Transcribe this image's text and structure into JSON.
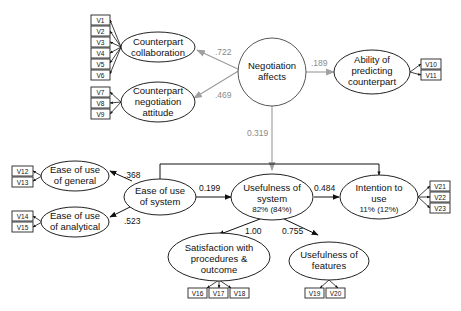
{
  "diagram": {
    "type": "structural-equation-model",
    "constructs": {
      "negotiation_affects": {
        "label_lines": [
          "Negotiation",
          "affects"
        ],
        "shape": "circle"
      },
      "counterpart_collaboration": {
        "label_lines": [
          "Counterpart",
          "collaboration"
        ],
        "indicators": [
          "V1",
          "V2",
          "V3",
          "V4",
          "V5",
          "V6"
        ]
      },
      "counterpart_negotiation_attitude": {
        "label_lines": [
          "Counterpart",
          "negotiation",
          "attitude"
        ],
        "indicators": [
          "V7",
          "V8",
          "V9"
        ]
      },
      "ability_predicting_counterpart": {
        "label_lines": [
          "Ability of",
          "predicting",
          "counterpart"
        ],
        "indicators": [
          "V10",
          "V11"
        ]
      },
      "ease_of_use_general": {
        "label_lines": [
          "Ease of use",
          "of general"
        ],
        "indicators": [
          "V12",
          "V13"
        ]
      },
      "ease_of_use_analytical": {
        "label_lines": [
          "Ease of use",
          "of analytical"
        ],
        "indicators": [
          "V14",
          "V15"
        ]
      },
      "ease_of_use_system": {
        "label_lines": [
          "Ease of use",
          "of system"
        ]
      },
      "usefulness_of_system": {
        "label_lines": [
          "Usefulness of",
          "system"
        ],
        "variance": "82% (84%)"
      },
      "intention_to_use": {
        "label_lines": [
          "Intention to",
          "use"
        ],
        "variance": "11% (12%)",
        "indicators": [
          "V21",
          "V22",
          "V23"
        ]
      },
      "satisfaction": {
        "label_lines": [
          "Satisfaction with",
          "procedures &",
          "outcome"
        ],
        "indicators": [
          "V16",
          "V17",
          "V18"
        ]
      },
      "usefulness_of_features": {
        "label_lines": [
          "Usefulness of",
          "features"
        ],
        "indicators": [
          "V19",
          "V20"
        ]
      }
    },
    "paths": [
      {
        "from": "Negotiation affects",
        "to": "Counterpart collaboration",
        "coef": ".722",
        "style": "grey"
      },
      {
        "from": "Negotiation affects",
        "to": "Counterpart negotiation attitude",
        "coef": ".469",
        "style": "grey"
      },
      {
        "from": "Negotiation affects",
        "to": "Ability of predicting counterpart",
        "coef": ".189",
        "style": "grey"
      },
      {
        "from": "Negotiation affects",
        "to": "Usefulness of system",
        "coef": "0.319",
        "style": "grey"
      },
      {
        "from": "Ease of use of system",
        "to": "Ease of use of general",
        "coef": ".368",
        "style": "black"
      },
      {
        "from": "Ease of use of system",
        "to": "Ease of use of analytical",
        "coef": ".523",
        "style": "black"
      },
      {
        "from": "Ease of use of system",
        "to": "Usefulness of system",
        "coef": "0.199",
        "style": "black"
      },
      {
        "from": "Usefulness of system",
        "to": "Intention to use",
        "coef": "0.484",
        "style": "black"
      },
      {
        "from": "Usefulness of system",
        "to": "Satisfaction with procedures & outcome",
        "coef": "1.00",
        "style": "black"
      },
      {
        "from": "Usefulness of system",
        "to": "Usefulness of features",
        "coef": "0.755",
        "style": "black"
      },
      {
        "from": "Ease of use of system",
        "to": "Intention to use",
        "coef": "",
        "style": "black"
      }
    ]
  }
}
